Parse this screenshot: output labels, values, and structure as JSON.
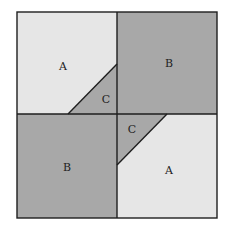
{
  "diagram": {
    "colors": {
      "light": "#e6e6e6",
      "dark": "#a8a8a8",
      "line": "#1e1e1e"
    },
    "labels": {
      "top_left": "A",
      "top_right": "B",
      "center_upper": "C",
      "center_lower": "C",
      "bottom_left": "B",
      "bottom_right": "A"
    }
  }
}
